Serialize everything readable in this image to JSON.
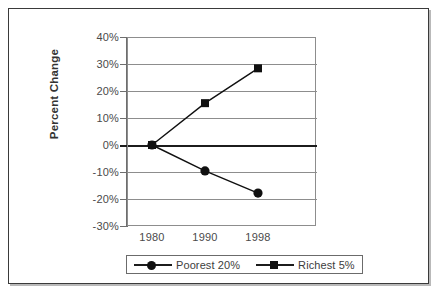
{
  "figure": {
    "background": "#ffffff",
    "frame_color": "#3a3a3a"
  },
  "chart_data": {
    "type": "line",
    "title": "",
    "subtitle": "",
    "xlabel": "",
    "ylabel": "Percent Change",
    "categories": [
      "1980",
      "1990",
      "1998"
    ],
    "series": [
      {
        "name": "Poorest 20%",
        "marker": "circle",
        "color": "#101010",
        "values": [
          0,
          -9.6,
          -17.8
        ]
      },
      {
        "name": "Richest 5%",
        "marker": "square",
        "color": "#101010",
        "values": [
          0,
          15.5,
          28.4
        ]
      }
    ],
    "ylim": [
      -30,
      40
    ],
    "ytick_values": [
      40,
      30,
      20,
      10,
      0,
      -10,
      -20,
      -30
    ],
    "ytick_labels": [
      "40%",
      "30%",
      "20%",
      "10%",
      "0%",
      "-10%",
      "-20%",
      "-30%"
    ],
    "xtick_labels": [
      "1980",
      "1990",
      "1998"
    ],
    "grid": "horizontal",
    "zero_line_emphasis": true,
    "legend_position": "bottom-center",
    "legend_entries": [
      "Poorest 20%",
      "Richest 5%"
    ],
    "gridline_color": "#8d8d8d",
    "zero_line_color": "#1c1c1c"
  },
  "axes": {
    "y_title": "Percent Change",
    "y_labels": [
      "40%",
      "30%",
      "20%",
      "10%",
      "0%",
      "-10%",
      "-20%",
      "-30%"
    ],
    "x_labels": [
      "1980",
      "1990",
      "1998"
    ]
  },
  "legend": {
    "entries": [
      {
        "label": "Poorest 20%",
        "marker": "circle-marker"
      },
      {
        "label": "Richest 5%",
        "marker": "square-marker"
      }
    ]
  }
}
